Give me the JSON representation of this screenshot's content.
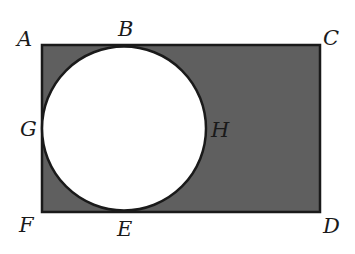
{
  "diagram": {
    "type": "geometry",
    "colors": {
      "shade": "#5f5f5f",
      "stroke": "#1a1a1a",
      "circle_fill": "#ffffff",
      "background": "#ffffff"
    },
    "rectangle": {
      "vertices": [
        "A",
        "C",
        "D",
        "F"
      ],
      "x": 42,
      "y": 45,
      "width": 278,
      "height": 167
    },
    "circle": {
      "cx": 124,
      "cy": 128.5,
      "r": 82,
      "tangent_points": [
        "B",
        "G",
        "E"
      ],
      "rightmost_point": "H"
    },
    "labels": [
      {
        "id": "A",
        "text": "A",
        "x": 17,
        "y": 46
      },
      {
        "id": "B",
        "text": "B",
        "x": 118,
        "y": 36
      },
      {
        "id": "C",
        "text": "C",
        "x": 323,
        "y": 45
      },
      {
        "id": "G",
        "text": "G",
        "x": 20,
        "y": 136
      },
      {
        "id": "H",
        "text": "H",
        "x": 211,
        "y": 137
      },
      {
        "id": "F",
        "text": "F",
        "x": 19,
        "y": 232
      },
      {
        "id": "E",
        "text": "E",
        "x": 117,
        "y": 236
      },
      {
        "id": "D",
        "text": "D",
        "x": 323,
        "y": 233
      }
    ]
  }
}
